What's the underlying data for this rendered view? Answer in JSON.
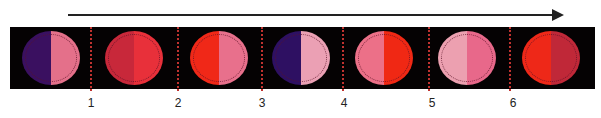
{
  "arrow": {
    "direction": "right",
    "color": "#222222"
  },
  "strip": {
    "background": "#050203",
    "divider_color": "#c0322f"
  },
  "circles": [
    {
      "left_color": "#3a1060",
      "right_color": "#e4708a"
    },
    {
      "left_color": "#c8283a",
      "right_color": "#e8303a"
    },
    {
      "left_color": "#f02818",
      "right_color": "#e8708c"
    },
    {
      "left_color": "#2e1062",
      "right_color": "#eba0b4"
    },
    {
      "left_color": "#ec7088",
      "right_color": "#f02814"
    },
    {
      "left_color": "#eca0b0",
      "right_color": "#e8688a"
    },
    {
      "left_color": "#ee2818",
      "right_color": "#c02838"
    }
  ],
  "labels": [
    "1",
    "2",
    "3",
    "4",
    "5",
    "6"
  ]
}
